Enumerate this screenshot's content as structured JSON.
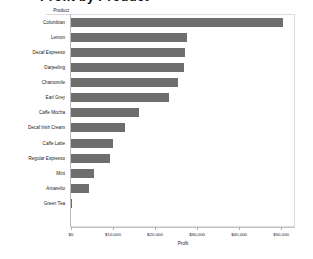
{
  "chart_data": {
    "type": "bar",
    "orientation": "horizontal",
    "title": "Profit by Product",
    "xlabel": "Profit",
    "ylabel": "Product",
    "categories": [
      "Columbian",
      "Lemon",
      "Decaf Espresso",
      "Darjeeling",
      "Chamomile",
      "Earl Grey",
      "Caffe Mocha",
      "Decaf Irish Cream",
      "Caffe Latte",
      "Regular Espresso",
      "Mint",
      "Amaretto",
      "Green Tea"
    ],
    "values": [
      50500,
      27600,
      27100,
      26900,
      25500,
      23300,
      16200,
      12900,
      10000,
      9300,
      5500,
      4300,
      300
    ],
    "xlim": [
      0,
      53300
    ],
    "x_ticks": [
      0,
      10000,
      20000,
      30000,
      40000,
      50000
    ],
    "x_tick_labels": [
      "$0",
      "$10,000",
      "$20,000",
      "$30,000",
      "$40,000",
      "$50,000"
    ],
    "grid": false,
    "legend": false,
    "bar_color": "#6e6e6e",
    "axis_color": "#c4c4c4",
    "frame_color": "#dcdcdc",
    "text_color": "#222222"
  }
}
